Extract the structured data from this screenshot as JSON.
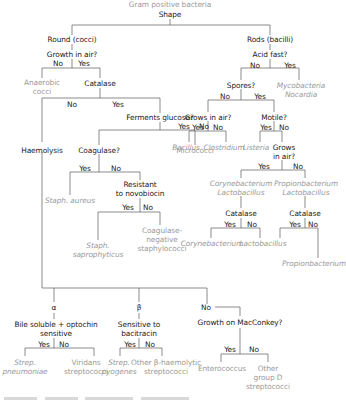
{
  "title": "Gram positive bacteria",
  "root": "Shape",
  "colors": {
    "question": "#1a1a1a",
    "result": "#9a9a9a",
    "line": "#5a5a5a"
  },
  "cocci": {
    "label": "Round (cocci)",
    "growth_in_air": "Growth in air?",
    "no": "No",
    "yes": "Yes",
    "anaerobic": [
      "Anaerobic",
      "cocci"
    ],
    "catalase": "Catalase",
    "catalase_no": "No",
    "catalase_yes": "Yes",
    "ferments_glucose": "Ferments glucose?",
    "fg_yes": "Yes",
    "fg_no": "No",
    "micrococci": "Micrococci",
    "coagulase": "Coagulase?",
    "coag_yes": "Yes",
    "coag_no": "No",
    "staph_aureus": "Staph. aureus",
    "novobiocin": [
      "Resistant",
      "to novobiocin"
    ],
    "novo_yes": "Yes",
    "novo_no": "No",
    "staph_sapro": [
      "Staph.",
      "saprophyticus"
    ],
    "coag_neg": [
      "Coagulase-",
      "negative",
      "staphylococci"
    ],
    "haemolysis": "Haemolysis",
    "alpha": "α",
    "beta": "β",
    "gamma_no": "No",
    "bile": [
      "Bile soluble + optochin",
      "sensitive"
    ],
    "bile_yes": "Yes",
    "bile_no": "No",
    "strep_pneu": [
      "Strep.",
      "pneumoniae"
    ],
    "viridans": [
      "Viridans",
      "streptococci"
    ],
    "bacitracin": [
      "Sensitive to",
      "bacitracin"
    ],
    "bac_yes": "Yes",
    "bac_no": "No",
    "strep_pyo": [
      "Strep.",
      "pyogenes"
    ],
    "other_beta": [
      "Other β-haemolytic",
      "streptococci"
    ],
    "maccon": "Growth on MacConkey?",
    "mac_yes": "Yes",
    "mac_no": "No",
    "enterococcus": "Enterococcus",
    "group_d": [
      "Other",
      "group D",
      "streptococci"
    ]
  },
  "rods": {
    "label": "Rods (bacilli)",
    "acid_fast": "Acid fast?",
    "no": "No",
    "yes": "Yes",
    "myco": [
      "Mycobacteria",
      "Nocardia"
    ],
    "spores": "Spores?",
    "sp_no": "No",
    "sp_yes": "Yes",
    "grows_air": "Grows in air?",
    "ga_yes": "Yes",
    "ga_no": "No",
    "bacillus": "Bacillus",
    "clostridium": "Clostridium",
    "motile": "Motile?",
    "mo_yes": "Yes",
    "mo_no": "No",
    "listeria": "Listeria",
    "grows_air2": [
      "Grows",
      "in air?"
    ],
    "ga2_yes": "Yes",
    "ga2_no": "No",
    "coryne_lacto": [
      "Corynebacterium",
      "Lactobacillus"
    ],
    "propi_lacto": [
      "Propionbacterium",
      "Lactobacillus"
    ],
    "catalase_l": "Catalase",
    "cl_yes": "Yes",
    "cl_no": "No",
    "corynebacterium": "Corynebacterium",
    "lactobacillus": "Lactobacillus",
    "catalase_r": "Catalase",
    "cr_yes": "Yes",
    "cr_no": "No",
    "propionbacterium": "Propionbacterium"
  }
}
